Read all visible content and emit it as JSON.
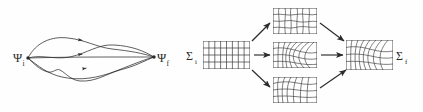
{
  "figure": {
    "background": "#fefefe",
    "ink": "#2b2b2b",
    "width": 423,
    "height": 112,
    "panels": [
      {
        "id": "path-integral-panel",
        "name": "wavefunction-path-panel",
        "start_label": "Ψ",
        "start_sub": "i",
        "end_label": "Ψ",
        "end_sub": "f",
        "path_count": 4,
        "description": "multiple wiggly trajectories connecting initial and final states"
      },
      {
        "id": "grid-deformation-panel",
        "name": "surface-deformation-panel",
        "start_label": "Σ",
        "start_sub": "i",
        "end_label": "Σ",
        "end_sub": "f",
        "branch_count": 3,
        "description": "regular mesh deformed through three intermediate meshes into a final mesh"
      }
    ],
    "grids": [
      {
        "name": "grid-initial",
        "label": "Σ",
        "sub": "i",
        "cols": 8,
        "rows": 4,
        "distortion": "none"
      },
      {
        "name": "grid-branch-top",
        "label": "",
        "sub": "",
        "cols": 7,
        "rows": 4,
        "distortion": "wavy"
      },
      {
        "name": "grid-branch-middle",
        "label": "",
        "sub": "",
        "cols": 7,
        "rows": 4,
        "distortion": "swirl"
      },
      {
        "name": "grid-branch-bottom",
        "label": "",
        "sub": "",
        "cols": 7,
        "rows": 4,
        "distortion": "fan"
      },
      {
        "name": "grid-final",
        "label": "Σ",
        "sub": "f",
        "cols": 8,
        "rows": 4,
        "distortion": "swirl"
      }
    ],
    "arrows": [
      {
        "name": "arrow-initial-to-top",
        "from": "grid-initial",
        "to": "grid-branch-top"
      },
      {
        "name": "arrow-initial-to-middle",
        "from": "grid-initial",
        "to": "grid-branch-middle"
      },
      {
        "name": "arrow-initial-to-bottom",
        "from": "grid-initial",
        "to": "grid-branch-bottom"
      },
      {
        "name": "arrow-top-to-final",
        "from": "grid-branch-top",
        "to": "grid-final"
      },
      {
        "name": "arrow-middle-to-final",
        "from": "grid-branch-middle",
        "to": "grid-final"
      },
      {
        "name": "arrow-bottom-to-final",
        "from": "grid-branch-bottom",
        "to": "grid-final"
      }
    ]
  }
}
